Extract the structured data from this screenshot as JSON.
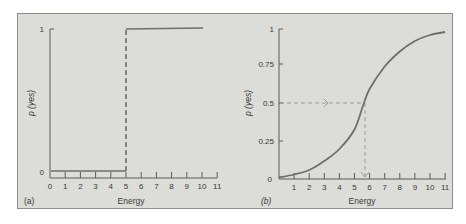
{
  "chart_data": [
    {
      "panel": "(a)",
      "type": "line",
      "title": "",
      "xlabel": "Energy",
      "ylabel": "p (yes)",
      "x_ticks": [
        0,
        1,
        2,
        3,
        4,
        5,
        6,
        7,
        8,
        9,
        10,
        11
      ],
      "y_ticks": [
        0,
        1
      ],
      "xlim": [
        0,
        11
      ],
      "ylim": [
        0,
        1
      ],
      "grid": false,
      "series": [
        {
          "name": "step threshold",
          "points": [
            [
              0,
              0
            ],
            [
              5,
              0
            ],
            [
              5,
              1
            ],
            [
              10,
              1
            ]
          ],
          "note": "vertical jump at energy 5 drawn dashed"
        }
      ],
      "annotations": [
        "dashed vertical line at Energy = 5"
      ]
    },
    {
      "panel": "(b)",
      "type": "line",
      "title": "",
      "xlabel": "Energy",
      "ylabel": "p (yes)",
      "x_ticks": [
        0,
        1,
        2,
        3,
        4,
        5,
        6,
        7,
        8,
        9,
        10,
        11
      ],
      "y_ticks": [
        0,
        0.25,
        0.5,
        0.75,
        1
      ],
      "xlim": [
        0,
        11
      ],
      "ylim": [
        0,
        1
      ],
      "grid": false,
      "series": [
        {
          "name": "psychometric function",
          "points": [
            [
              0,
              0.01
            ],
            [
              1,
              0.03
            ],
            [
              2,
              0.06
            ],
            [
              3,
              0.12
            ],
            [
              4,
              0.2
            ],
            [
              5,
              0.33
            ],
            [
              5.6,
              0.5
            ],
            [
              6,
              0.6
            ],
            [
              7,
              0.75
            ],
            [
              8,
              0.85
            ],
            [
              9,
              0.92
            ],
            [
              10,
              0.96
            ],
            [
              11,
              0.98
            ]
          ]
        }
      ],
      "annotations": [
        "dashed horizontal arrow at p = 0.5 pointing to curve",
        "dashed vertical arrow down at Energy ≈ 5.6 (threshold)"
      ]
    }
  ],
  "panels": {
    "a": {
      "label": "(a)",
      "xlabel": "Energy",
      "ylabel": "p (yes)",
      "x_tick_labels": [
        "0",
        "1",
        "2",
        "3",
        "4",
        "5",
        "6",
        "7",
        "8",
        "9",
        "10",
        "11"
      ],
      "y_tick_labels": [
        "0",
        "1"
      ]
    },
    "b": {
      "label": "(b)",
      "xlabel": "Energy",
      "ylabel": "p (yes)",
      "x_tick_labels": [
        "0",
        "1",
        "2",
        "3",
        "4",
        "5",
        "6",
        "7",
        "8",
        "9",
        "10",
        "11"
      ],
      "y_tick_labels": [
        "0",
        "0.25",
        "0.5",
        "0.75",
        "1"
      ]
    }
  },
  "colors": {
    "background": "#dcdcd8",
    "frame": "#8e8e8a",
    "data_line": "#6e6e6c",
    "axis": "#5a5a58",
    "dashed_guides": "#9a9a96",
    "text": "#3a3a3a"
  }
}
